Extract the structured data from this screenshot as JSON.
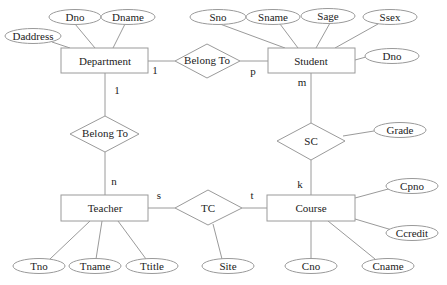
{
  "entities": {
    "department": "Department",
    "student": "Student",
    "teacher": "Teacher",
    "course": "Course"
  },
  "relationships": {
    "belong_to_dept_student": "Belong To",
    "belong_to_dept_teacher": "Belong To",
    "sc": "SC",
    "tc": "TC"
  },
  "attributes": {
    "department": [
      "Dno",
      "Dname",
      "Daddress"
    ],
    "student": [
      "Sno",
      "Sname",
      "Sage",
      "Ssex",
      "Dno"
    ],
    "teacher": [
      "Tno",
      "Tname",
      "Ttitle"
    ],
    "course": [
      "Cpno",
      "Ccredit",
      "Cno",
      "Cname"
    ],
    "sc": [
      "Grade"
    ],
    "tc": [
      "Site"
    ]
  },
  "cardinalities": {
    "dept_student_dept": "1",
    "dept_student_student": "p",
    "dept_teacher_dept": "1",
    "dept_teacher_teacher": "n",
    "sc_student": "m",
    "sc_course": "k",
    "tc_teacher": "s",
    "tc_course": "t"
  }
}
